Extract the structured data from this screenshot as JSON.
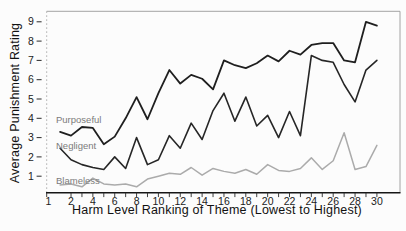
{
  "chart_data": {
    "type": "line",
    "title": "",
    "xlabel": "Harm Level Ranking of Theme (Lowest to Highest)",
    "ylabel": "Average Punishment Rating",
    "x": [
      1,
      2,
      3,
      4,
      5,
      6,
      7,
      8,
      9,
      10,
      11,
      12,
      13,
      14,
      15,
      16,
      17,
      18,
      19,
      20,
      21,
      22,
      23,
      24,
      25,
      26,
      27,
      28,
      29,
      30
    ],
    "x_tick_labels": [
      1,
      2,
      4,
      6,
      8,
      10,
      12,
      14,
      16,
      18,
      20,
      22,
      24,
      26,
      28,
      30
    ],
    "y_ticks": [
      1,
      2,
      3,
      4,
      5,
      6,
      7,
      8,
      9
    ],
    "ylim": [
      0.1,
      9.55
    ],
    "xlim": [
      1,
      30
    ],
    "grid": false,
    "legend_position": "inline-labels-left",
    "series": [
      {
        "name": "Purposeful",
        "color": "#1f1f1f",
        "line_width": 1.8,
        "values": [
          3.3,
          3.1,
          3.55,
          3.5,
          2.65,
          3.05,
          4.0,
          5.1,
          3.95,
          5.3,
          6.5,
          5.8,
          6.25,
          6.05,
          5.5,
          7.0,
          6.75,
          6.6,
          6.85,
          7.25,
          6.95,
          7.5,
          7.3,
          7.8,
          7.9,
          7.9,
          7.0,
          6.9,
          9.0,
          8.8
        ]
      },
      {
        "name": "Negligent",
        "color": "#262626",
        "line_width": 1.6,
        "values": [
          2.45,
          1.85,
          1.6,
          1.45,
          1.35,
          2.0,
          1.4,
          3.0,
          1.6,
          1.85,
          3.1,
          2.45,
          3.75,
          2.9,
          4.4,
          5.3,
          3.85,
          5.1,
          3.6,
          4.15,
          3.0,
          4.35,
          3.1,
          7.25,
          7.0,
          6.9,
          5.75,
          4.85,
          6.5,
          7.0
        ]
      },
      {
        "name": "Blameless",
        "color": "#ababab",
        "line_width": 1.5,
        "values": [
          0.55,
          0.6,
          0.45,
          0.9,
          0.6,
          0.55,
          0.6,
          0.45,
          0.85,
          1.0,
          1.15,
          1.1,
          1.45,
          1.05,
          1.4,
          1.25,
          1.15,
          1.35,
          1.1,
          1.6,
          1.3,
          1.25,
          1.4,
          1.95,
          1.35,
          1.8,
          3.25,
          1.35,
          1.5,
          2.6
        ]
      }
    ],
    "series_label_color": "#7b7b7b",
    "axis_colors": {
      "border_top_right": "#9a9a9a",
      "border_left_dotted": "#b0b0b0",
      "border_bottom": "#161616",
      "tick_color": "#2a2a2a"
    }
  }
}
